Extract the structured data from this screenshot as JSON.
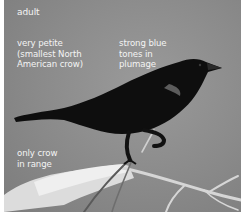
{
  "image": {
    "subject": "crow",
    "palette": {
      "background": "#8c8c8c",
      "bird": "#0d0d0d",
      "text": "#f4f4f4",
      "branch": "#d8d8d8",
      "border": "#ffffff"
    }
  },
  "labels": {
    "age": "adult",
    "size": "very petite\n(smallest North\nAmerican crow)",
    "plumage": "strong blue\ntones in\nplumage",
    "range": "only crow\nin range"
  }
}
